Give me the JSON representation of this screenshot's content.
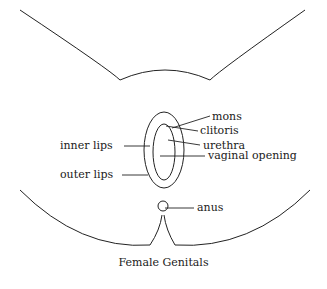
{
  "diagram": {
    "caption": "Female Genitals",
    "labels": {
      "mons": "mons",
      "clitoris": "clitoris",
      "urethra": "urethra",
      "inner_lips": "inner lips",
      "vaginal_opening": "vaginal opening",
      "outer_lips": "outer lips",
      "anus": "anus"
    }
  }
}
